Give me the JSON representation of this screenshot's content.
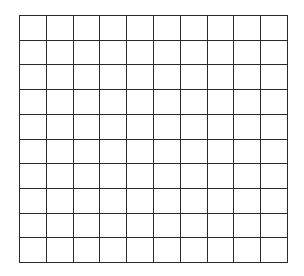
{
  "grid": {
    "rows": 10,
    "columns": 10,
    "line_color": "#2a2a2a",
    "background": "#ffffff"
  }
}
